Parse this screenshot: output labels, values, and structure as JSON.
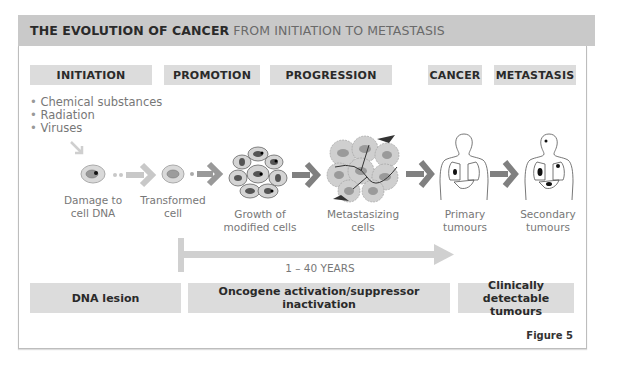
{
  "title": {
    "bold": "THE EVOLUTION OF CANCER",
    "light": "FROM INITIATION TO METASTASIS"
  },
  "stages": [
    {
      "label": "INITIATION"
    },
    {
      "label": "PROMOTION"
    },
    {
      "label": "PROGRESSION"
    },
    {
      "label": "CANCER"
    },
    {
      "label": "METASTASIS"
    }
  ],
  "causes": [
    "Chemical substances",
    "Radiation",
    "Viruses"
  ],
  "steps": [
    {
      "line1": "Damage to",
      "line2": "cell DNA"
    },
    {
      "line1": "Transformed",
      "line2": "cell"
    },
    {
      "line1": "Growth of",
      "line2": "modified cells"
    },
    {
      "line1": "Metastasizing",
      "line2": "cells"
    },
    {
      "line1": "Primary",
      "line2": "tumours"
    },
    {
      "line1": "Secondary",
      "line2": "tumours"
    }
  ],
  "timeline": {
    "label": "1 – 40 YEARS"
  },
  "bottom": [
    {
      "label": "DNA lesion"
    },
    {
      "label": "Oncogene activation/suppressor inactivation"
    },
    {
      "label": "Clinically detectable tumours"
    }
  ],
  "figure_label": "Figure 5",
  "colors": {
    "header_bg": "#c9c9c9",
    "box_bg": "#dcdcdc",
    "arrow": "#8a8a8a",
    "arrow_light": "#c8c8c8"
  }
}
